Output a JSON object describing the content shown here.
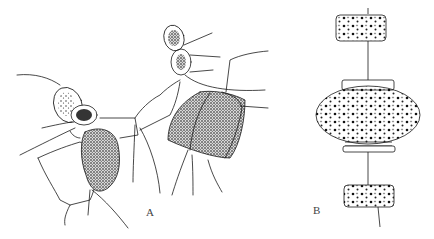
{
  "figure": {
    "panels": [
      {
        "id": "A",
        "label": "A",
        "description": "chain of diatom cells with long setae, two large stippled rectangular cells and small oval cells"
      },
      {
        "id": "B",
        "label": "B",
        "description": "chain of three disc-shaped diatom cells connected by central threads"
      }
    ],
    "colors": {
      "ink": "#1a1a1a",
      "background": "#ffffff"
    }
  }
}
